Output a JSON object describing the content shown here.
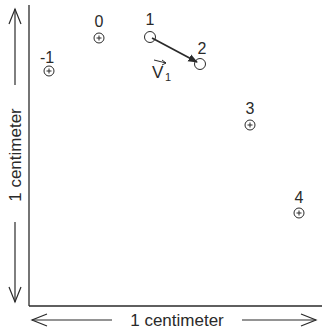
{
  "diagram": {
    "points": [
      {
        "label": "-1",
        "x": 49,
        "y": 71,
        "lx": 47,
        "ly": 63
      },
      {
        "label": "0",
        "x": 99,
        "y": 38,
        "lx": 99,
        "ly": 27
      },
      {
        "label": "1",
        "x": 150,
        "y": 37,
        "lx": 150,
        "ly": 25
      },
      {
        "label": "2",
        "x": 200,
        "y": 64,
        "lx": 202,
        "ly": 54
      },
      {
        "label": "3",
        "x": 250,
        "y": 125,
        "lx": 250,
        "ly": 114
      },
      {
        "label": "4",
        "x": 299,
        "y": 213,
        "lx": 299,
        "ly": 203
      }
    ],
    "vector": {
      "label": "V",
      "subscript": "1",
      "from": "1",
      "to": "2"
    },
    "horizontal_scale_label": "1 centimeter",
    "vertical_scale_label": "1 centimeter",
    "colors": {
      "ink": "#2a2a2a",
      "background": "#ffffff"
    }
  }
}
